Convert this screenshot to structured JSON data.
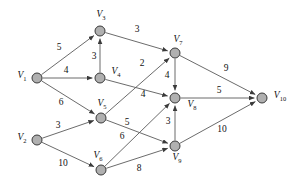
{
  "diagram": {
    "type": "directed-weighted-graph",
    "title": "",
    "node_radius": 5,
    "node_fill": "#b0b0b0",
    "node_stroke": "#3a3a3a",
    "edge_color": "#5a5a5a",
    "background": "#ffffff",
    "nodes": [
      {
        "id": "V1",
        "label": "V",
        "sub": "1",
        "x": 37,
        "y": 78,
        "label_x": 22,
        "label_y": 77
      },
      {
        "id": "V2",
        "label": "V",
        "sub": "2",
        "x": 37,
        "y": 140,
        "label_x": 22,
        "label_y": 139
      },
      {
        "id": "V3",
        "label": "V",
        "sub": "3",
        "x": 100,
        "y": 31,
        "label_x": 101,
        "label_y": 16
      },
      {
        "id": "V4",
        "label": "V",
        "sub": "4",
        "x": 100,
        "y": 78,
        "label_x": 116,
        "label_y": 73
      },
      {
        "id": "V5",
        "label": "V",
        "sub": "5",
        "x": 101,
        "y": 118,
        "label_x": 102,
        "label_y": 105
      },
      {
        "id": "V6",
        "label": "V",
        "sub": "6",
        "x": 101,
        "y": 170,
        "label_x": 98,
        "label_y": 157
      },
      {
        "id": "V7",
        "label": "V",
        "sub": "7",
        "x": 175,
        "y": 53,
        "label_x": 178,
        "label_y": 41
      },
      {
        "id": "V8",
        "label": "V",
        "sub": "8",
        "x": 175,
        "y": 98,
        "label_x": 192,
        "label_y": 106
      },
      {
        "id": "V9",
        "label": "V",
        "sub": "9",
        "x": 175,
        "y": 146,
        "label_x": 177,
        "label_y": 159
      },
      {
        "id": "V10",
        "label": "V",
        "sub": "10",
        "x": 262,
        "y": 98,
        "label_x": 280,
        "label_y": 97
      }
    ],
    "edges": [
      {
        "from": "V1",
        "to": "V3",
        "weight": "5",
        "label_x": 59,
        "label_y": 48
      },
      {
        "from": "V1",
        "to": "V4",
        "weight": "4",
        "label_x": 66,
        "label_y": 71
      },
      {
        "from": "V1",
        "to": "V5",
        "weight": "6",
        "label_x": 61,
        "label_y": 103
      },
      {
        "from": "V4",
        "to": "V3",
        "weight": "3",
        "label_x": 94,
        "label_y": 57
      },
      {
        "from": "V3",
        "to": "V7",
        "weight": "3",
        "label_x": 137,
        "label_y": 30
      },
      {
        "from": "V4",
        "to": "V8",
        "weight": "4",
        "label_x": 143,
        "label_y": 95
      },
      {
        "from": "V5",
        "to": "V7",
        "weight": "2",
        "label_x": 142,
        "label_y": 64
      },
      {
        "from": "V5",
        "to": "V9",
        "weight": "5",
        "label_x": 127,
        "label_y": 123
      },
      {
        "from": "V2",
        "to": "V5",
        "weight": "3",
        "label_x": 58,
        "label_y": 126
      },
      {
        "from": "V2",
        "to": "V6",
        "weight": "10",
        "label_x": 63,
        "label_y": 164
      },
      {
        "from": "V6",
        "to": "V8",
        "weight": "6",
        "label_x": 122,
        "label_y": 137
      },
      {
        "from": "V6",
        "to": "V9",
        "weight": "8",
        "label_x": 139,
        "label_y": 169
      },
      {
        "from": "V7",
        "to": "V8",
        "weight": "4",
        "label_x": 167,
        "label_y": 76
      },
      {
        "from": "V9",
        "to": "V8",
        "weight": "3",
        "label_x": 168,
        "label_y": 122
      },
      {
        "from": "V7",
        "to": "V10",
        "weight": "9",
        "label_x": 226,
        "label_y": 69
      },
      {
        "from": "V8",
        "to": "V10",
        "weight": "5",
        "label_x": 219,
        "label_y": 91
      },
      {
        "from": "V9",
        "to": "V10",
        "weight": "10",
        "label_x": 222,
        "label_y": 130
      }
    ]
  }
}
